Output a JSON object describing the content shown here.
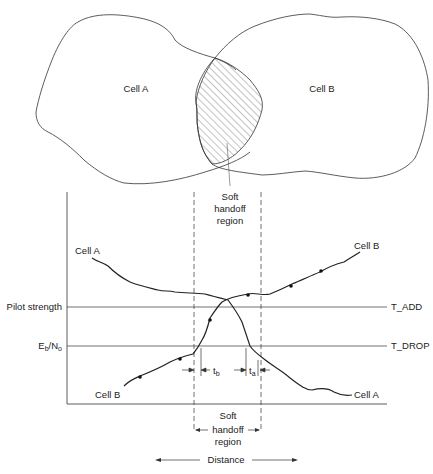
{
  "top_diagram": {
    "cell_a_label": "Cell A",
    "cell_b_label": "Cell B",
    "overlap_label_line1": "Soft",
    "overlap_label_line2": "handoff",
    "overlap_label_line3": "region"
  },
  "graph": {
    "y_axis_label_1": "Pilot strength",
    "y_axis_label_2_main": "E",
    "y_axis_label_2_sub1": "b",
    "y_axis_label_2_slash": "/N",
    "y_axis_label_2_sub2": "o",
    "t_add_label": "T_ADD",
    "t_drop_label": "T_DROP",
    "curve_a_start_label": "Cell A",
    "curve_a_end_label": "Cell A",
    "curve_b_start_label": "Cell B",
    "curve_b_end_label": "Cell B",
    "tb_main": "t",
    "tb_sub": "b",
    "ta_main": "t",
    "ta_sub": "a",
    "region_label_line1": "Soft",
    "region_label_line2": "handoff",
    "region_label_line3": "region",
    "x_axis_label": "Distance"
  },
  "colors": {
    "line": "#333333",
    "hatch": "#555555",
    "background": "#ffffff"
  }
}
